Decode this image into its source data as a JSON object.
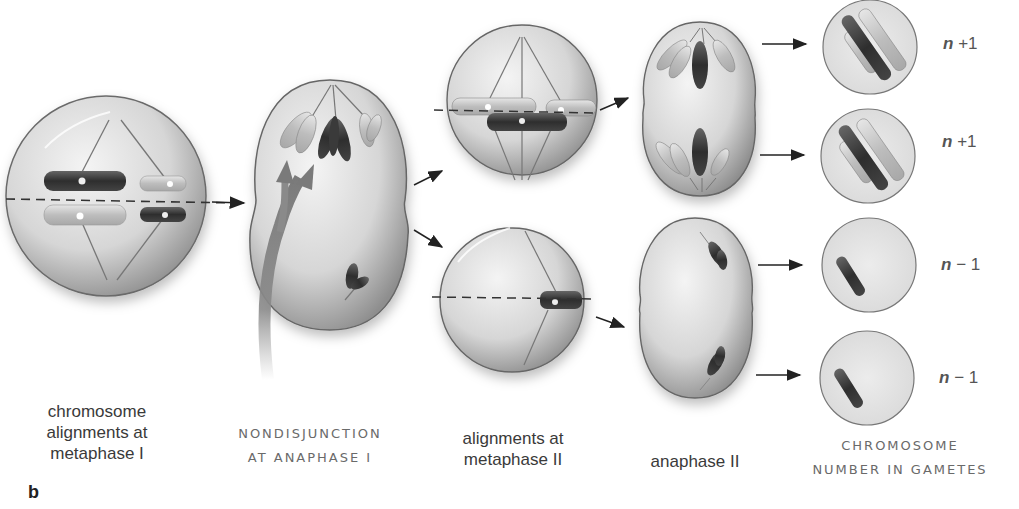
{
  "panel_letter": "b",
  "stages": [
    {
      "id": "metaphase-1",
      "label_lines": [
        "chromosome",
        "alignments at",
        "metaphase I"
      ],
      "style": "plain"
    },
    {
      "id": "nondisjunction",
      "label_lines": [
        "NONDISJUNCTION",
        "AT ANAPHASE I"
      ],
      "style": "caps"
    },
    {
      "id": "metaphase-2",
      "label_lines": [
        "alignments at",
        "metaphase II"
      ],
      "style": "plain"
    },
    {
      "id": "anaphase-2",
      "label_lines": [
        "anaphase II"
      ],
      "style": "plain"
    },
    {
      "id": "gametes",
      "label_lines": [
        "CHROMOSOME",
        "NUMBER IN GAMETES"
      ],
      "style": "caps"
    }
  ],
  "gametes": [
    {
      "n": "n",
      "op": "+",
      "value": "1",
      "text": "n + 1"
    },
    {
      "n": "n",
      "op": "+",
      "value": "1",
      "text": "n + 1"
    },
    {
      "n": "n",
      "op": "−",
      "value": "1",
      "text": "n − 1"
    },
    {
      "n": "n",
      "op": "−",
      "value": "1",
      "text": "n − 1"
    }
  ],
  "colors": {
    "cell_light": "#ececec",
    "cell_dark": "#9a9a9a",
    "chromosome_dark": "#3c3c3c",
    "chromosome_light": "#c8c8c8",
    "spindle": "#7a7a7a",
    "arrow": "#222222",
    "nondisjunction_arrow": "#8a8a8a"
  }
}
